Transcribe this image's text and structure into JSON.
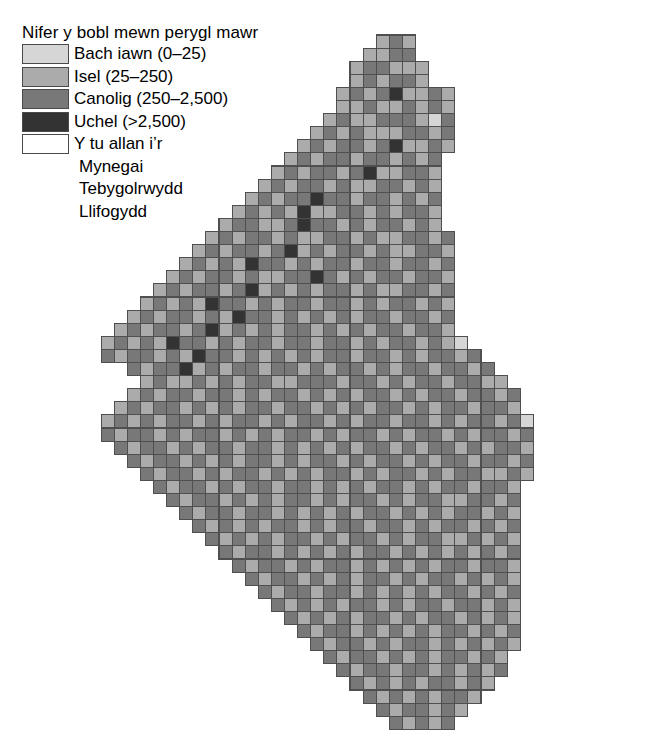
{
  "legend": {
    "title": "Nifer y bobl mewn perygl mawr",
    "entries": [
      {
        "label": "Bach iawn (0–25)",
        "color": "#d6d6d6",
        "key": "very-low"
      },
      {
        "label": "Isel (25–250)",
        "color": "#ababab",
        "key": "low"
      },
      {
        "label": "Canolig (250–2,500)",
        "color": "#787878",
        "key": "medium"
      },
      {
        "label": "Uchel (>2,500)",
        "color": "#333333",
        "key": "high"
      },
      {
        "label": "Y tu allan i’r",
        "color": "#ffffff",
        "key": "outside"
      }
    ],
    "continuation_lines": [
      "Mynegai",
      "Tebygolrwydd",
      "Llifogydd"
    ],
    "swatch_border_color": "#4a4a4a"
  },
  "map": {
    "grid_origin_x": 88,
    "grid_origin_y": 35,
    "cell_size": 13.1,
    "cell_border_color": "#4f4f4f",
    "palette": {
      "0": "#ffffff",
      "1": "#d6d6d6",
      "2": "#ababab",
      "3": "#787878",
      "4": "#333333"
    },
    "cols": 43,
    "rows": 53,
    "rows_data": [
      "00000000000000000000002320000000000000000000",
      "00000000000000000000022330000000000000000000",
      "00000000000000000000233222000000000000000000",
      "00000000000000000000232332000000000000000000",
      "00000000000000000002323422320000000000000000",
      "00000000000000000002232232320000000000000000",
      "00000000000000000023223332130000000000000000",
      "00000000000000000232322233230000000000000000",
      "00000000000000002323323422320000000000000000",
      "00000000000000023233233232300000000000000000",
      "00000000000000232332342233200000000000000000",
      "00000000000002323323223323200000000000000000",
      "00000000000023233433233232300000000000000000",
      "00000000000232324223323233200000000000000000",
      "00000000002332234332323323200000000000000000",
      "00000000023233232233232233230000000000000000",
      "00000000232332342323323223320000000000000000",
      "00000002323243323233233233230000000000000000",
      "00000023233232233432323323320000000000000000",
      "00000232332342323233232233230000000000000000",
      "00002323243323233233232332320000000000000000",
      "00023233232433232323233233230000000000000000",
      "00232332342323233232323323320000000000000000",
      "02323243323233233233232332321000000000000000",
      "03233232433232323233233232332300000000000000",
      "00032334232332332323323233233230000000000000",
      "00002322323233223332332323323322000000000000",
      "00023233233232332323233232332332300000000000",
      "00232332323233233232323323233233200000000000",
      "02323233232332323323233233232332310000000000",
      "03233232332323233232332323323233230000000000",
      "00323323233233232323233232332323320000000000",
      "00032332323233232332323323233233230000000000",
      "00003233232332323233232332323322320000000000",
      "00000323323233233232323323233233200000000000",
      "00000032332323233232332323322332300000000000",
      "00000003233233232323233232323323200000000000",
      "00000000323232332323323323233232300000000000",
      "00000000032323233232332323322323200000000000",
      "00000000003233232323233232323232300000000000",
      "00000000000323323233232323233233200000000000",
      "00000000000032332323233232332323200000000000",
      "00000000000003233233232323233232300000000000",
      "00000000000000323232332323323323200000000000",
      "00000000000000032323233232332323200000000000",
      "00000000000000003233232323233232300000000000",
      "00000000000000000323323233232323200000000000",
      "00000000000000000032332323233232000000000000",
      "00000000000000000003233233232323000000000000",
      "00000000000000000000323232332320000000000000",
      "00000000000000000000032323233200000000000000",
      "00000000000000000000003233232000000000000000",
      "00000000000000000000000323230000000000000000"
    ]
  },
  "chart_data": {
    "type": "heatmap",
    "title": "Nifer y bobl mewn perygl mawr",
    "xlabel": "",
    "ylabel": "",
    "grid": true,
    "legend_position": "top-left",
    "categories": [
      "Bach iawn (0–25)",
      "Isel (25–250)",
      "Canolig (250–2,500)",
      "Uchel (>2,500)",
      "Y tu allan i’r Mynegai Tebygolrwydd Llifogydd"
    ],
    "value_ranges": [
      {
        "label": "Bach iawn",
        "min": 0,
        "max": 25,
        "color": "#d6d6d6"
      },
      {
        "label": "Isel",
        "min": 25,
        "max": 250,
        "color": "#ababab"
      },
      {
        "label": "Canolig",
        "min": 250,
        "max": 2500,
        "color": "#787878"
      },
      {
        "label": "Uchel",
        "min": 2500,
        "max": null,
        "color": "#333333"
      },
      {
        "label": "Y tu allan i'r Mynegai",
        "min": null,
        "max": null,
        "color": "#ffffff"
      }
    ],
    "cell_size_km": null,
    "region": "England and Wales"
  }
}
